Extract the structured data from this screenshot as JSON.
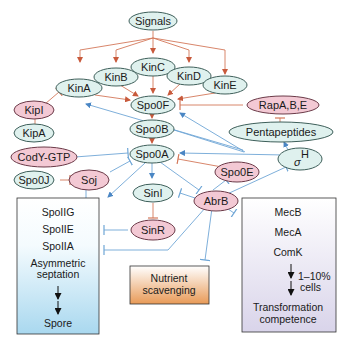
{
  "nodes": {
    "signals": "Signals",
    "kinA": "KinA",
    "kinB": "KinB",
    "kinC": "KinC",
    "kinD": "KinD",
    "kinE": "KinE",
    "kipI": "KipI",
    "kipA": "KipA",
    "spo0F": "Spo0F",
    "spo0B": "Spo0B",
    "spo0A": "Spo0A",
    "rap": "RapA,B,E",
    "pentapeptides": "Pentapeptides",
    "sigmaH_symbol": "σ",
    "sigmaH_sup": "H",
    "codY": "CodY-GTP",
    "spo0J": "Spo0J",
    "soj": "Soj",
    "spo0E": "Spo0E",
    "sinI": "SinI",
    "sinR": "SinR",
    "abrB": "AbrB"
  },
  "boxes": {
    "sporulation": {
      "lines": [
        "SpoIIG",
        "SpoIIE",
        "SpoIIA",
        "Asymmetric",
        "septation",
        "Spore"
      ]
    },
    "nutrient": {
      "lines": [
        "Nutrient",
        "scavenging"
      ]
    },
    "competence": {
      "lines": [
        "MecB",
        "MecA",
        "ComK",
        "1–10%",
        "cells",
        "Transformation",
        "competence"
      ]
    }
  },
  "legend_colors": {
    "activator_node": "#dff1ee",
    "repressor_node": "#f3c9d4",
    "phosphorelay_arrow": "#d4785a",
    "regulation_arrow": "#6fa6d6",
    "sporulation_box_gradient": [
      "#ffffff",
      "#a9d8ef"
    ],
    "nutrient_box_gradient": [
      "#ffffff",
      "#e89a57"
    ],
    "competence_box_gradient": [
      "#ffffff",
      "#d9d4ea"
    ]
  }
}
